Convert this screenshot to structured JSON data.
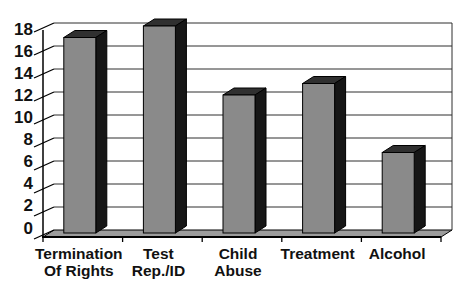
{
  "chart_data": {
    "type": "bar",
    "style": "3d-column",
    "title": "",
    "xlabel": "",
    "ylabel": "",
    "categories": [
      "Termination\nOf Rights",
      "Test\nRep./ID",
      "Child\nAbuse",
      "Treatment",
      "Alcohol"
    ],
    "values": [
      17,
      18,
      12,
      13,
      7
    ],
    "ylim": [
      0,
      18
    ],
    "ytick_step": 2,
    "yticks": [
      0,
      2,
      4,
      6,
      8,
      10,
      12,
      14,
      16,
      18
    ],
    "grid": true,
    "legend": "none",
    "colors": {
      "background": "#ffffff",
      "bar_front": "#8a8a8a",
      "bar_side": "#161616",
      "bar_top": "#303030",
      "floor": "#9c9c9c",
      "gridline": "#2e2e2e",
      "axis": "#000000",
      "label": "#111111"
    }
  }
}
